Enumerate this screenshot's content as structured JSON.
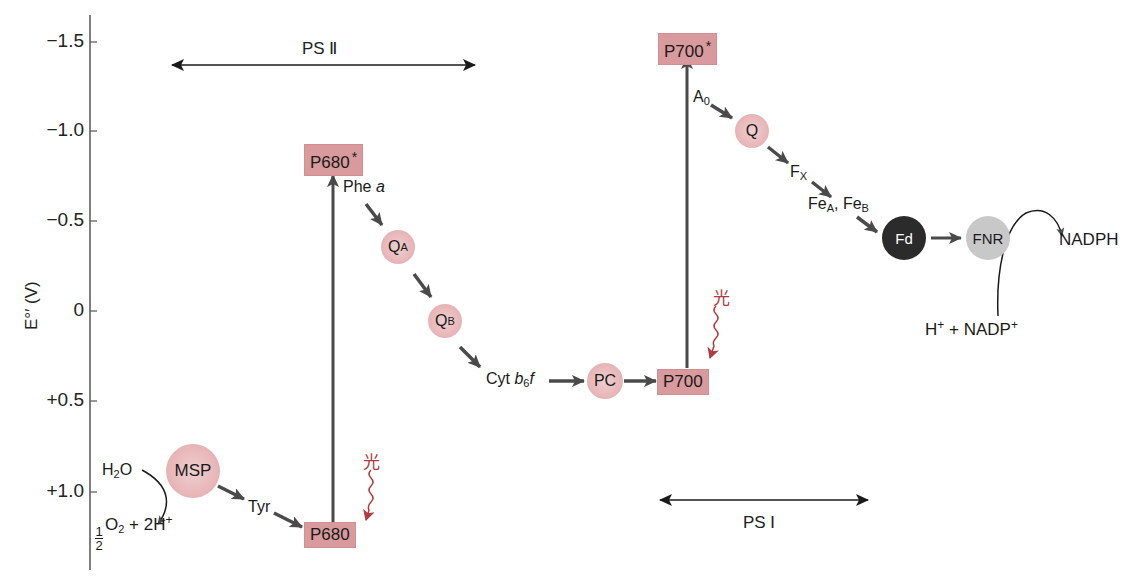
{
  "axis": {
    "title": "E°′ (V)",
    "ticks": [
      {
        "label": "−1.5",
        "value": -1.5,
        "y": 42
      },
      {
        "label": "−1.0",
        "value": -1.0,
        "y": 131
      },
      {
        "label": "−0.5",
        "value": -0.5,
        "y": 221
      },
      {
        "label": "0",
        "value": 0,
        "y": 311
      },
      {
        "label": "+0.5",
        "value": 0.5,
        "y": 401
      },
      {
        "label": "+1.0",
        "value": 1.0,
        "y": 492
      }
    ]
  },
  "ranges": {
    "ps2": {
      "label": "PS Ⅱ"
    },
    "ps1": {
      "label": "PS Ⅰ"
    }
  },
  "components": {
    "h2o": {
      "main": "H",
      "sub": "2",
      "tail": "O"
    },
    "o2_products": {
      "frac_num": "1",
      "frac_den": "2",
      "o": "O",
      "o_sub": "2",
      "plus": " + 2H",
      "sup": "+"
    },
    "msp": {
      "label": "MSP"
    },
    "tyr": {
      "label": "Tyr"
    },
    "p680": {
      "label": "P680"
    },
    "p680_star": {
      "label": "P680",
      "star": "*"
    },
    "phe_a": {
      "label": "Phe ",
      "italic": "a"
    },
    "qa": {
      "main": "Q",
      "sub": "A"
    },
    "qb": {
      "main": "Q",
      "sub": "B"
    },
    "cyt_b6f": {
      "pre": "Cyt ",
      "b": "b",
      "sub": "6",
      "f": "f"
    },
    "pc": {
      "label": "PC"
    },
    "p700": {
      "label": "P700"
    },
    "p700_star": {
      "label": "P700",
      "star": "*"
    },
    "a0": {
      "main": "A",
      "sub": "0"
    },
    "q": {
      "label": "Q"
    },
    "fx": {
      "main": "F",
      "sub": "X"
    },
    "fe": {
      "a_main": "Fe",
      "a_sub": "A",
      "sep": ", ",
      "b_main": "Fe",
      "b_sub": "B"
    },
    "fd": {
      "label": "Fd"
    },
    "fnr": {
      "label": "FNR"
    },
    "nadph": {
      "label": "NADPH"
    },
    "nadp_reactants": {
      "h": "H",
      "h_sup": "+",
      "plus": " + NADP",
      "sup": "+"
    }
  },
  "light": {
    "glyph": "光",
    "color": "#b03a3f"
  },
  "colors": {
    "box_fill": "#d89a9c",
    "circle_fill": "#e6b1b3",
    "fd_fill": "#2b2b2b",
    "fnr_fill": "#c8c8c8",
    "arrow": "#4a4a4a"
  }
}
